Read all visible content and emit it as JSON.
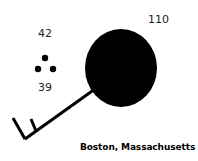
{
  "station": {
    "name": "Boston, Massachusetts",
    "sea_level_pressure": "110",
    "temperature": "42",
    "dew_point": "39",
    "present_weather": "light-snow",
    "sky_cover": "overcast",
    "wind": {
      "barbs": [
        "full",
        "half"
      ]
    }
  }
}
